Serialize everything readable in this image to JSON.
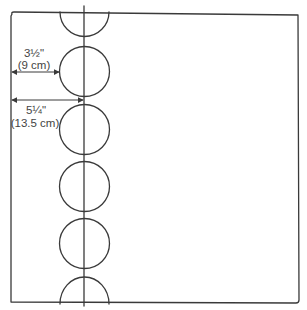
{
  "diagram": {
    "title": "",
    "stroke_color": "#3a3a3a",
    "text_color": "#444444",
    "dimensions": [
      {
        "id": "circle-edge-offset",
        "label_imperial": "3½\"",
        "label_metric": "(9 cm)"
      },
      {
        "id": "center-line-offset",
        "label_imperial": "5¼\"",
        "label_metric": "(13.5 cm)"
      }
    ],
    "circles": {
      "full_count": 4,
      "half_count": 2
    }
  }
}
